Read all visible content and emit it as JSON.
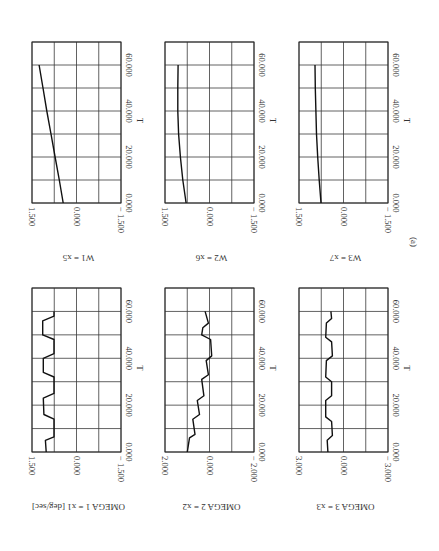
{
  "figure_label": "(a)",
  "chart_data": [
    {
      "type": "line",
      "id": "w1",
      "ylabel": "W1 = x5",
      "xlabel": "T",
      "value_ticks": [
        "1.500",
        "0.000",
        "− 1.500"
      ],
      "t_ticks": [
        "0.000",
        "20.000",
        "40.000",
        "60.000"
      ],
      "vlim": [
        -1.5,
        1.5
      ],
      "tlim": [
        0,
        70
      ],
      "grid": true,
      "points": [
        [
          0,
          0.45
        ],
        [
          10,
          0.58
        ],
        [
          20,
          0.72
        ],
        [
          30,
          0.86
        ],
        [
          40,
          1.0
        ],
        [
          50,
          1.13
        ],
        [
          60,
          1.26
        ]
      ]
    },
    {
      "type": "line",
      "id": "w2",
      "ylabel": "W2 = x6",
      "xlabel": "T",
      "value_ticks": [
        "1.500",
        "0.000",
        "− 1.500"
      ],
      "t_ticks": [
        "0.000",
        "20.000",
        "40.000",
        "60.000"
      ],
      "vlim": [
        -1.5,
        1.5
      ],
      "tlim": [
        0,
        70
      ],
      "grid": true,
      "points": [
        [
          0,
          0.79
        ],
        [
          10,
          0.9
        ],
        [
          20,
          0.98
        ],
        [
          30,
          1.04
        ],
        [
          40,
          1.07
        ],
        [
          50,
          1.07
        ],
        [
          60,
          1.06
        ]
      ]
    },
    {
      "type": "line",
      "id": "w3",
      "ylabel": "W3 = x7",
      "xlabel": "T",
      "value_ticks": [
        "1.500",
        "0.000",
        "− 1.500"
      ],
      "t_ticks": [
        "0.000",
        "20.000",
        "40.000",
        "60.000"
      ],
      "vlim": [
        -1.5,
        1.5
      ],
      "tlim": [
        0,
        70
      ],
      "grid": true,
      "points": [
        [
          0,
          0.76
        ],
        [
          10,
          0.82
        ],
        [
          20,
          0.87
        ],
        [
          30,
          0.91
        ],
        [
          40,
          0.93
        ],
        [
          50,
          0.95
        ],
        [
          60,
          0.96
        ]
      ]
    },
    {
      "type": "line",
      "id": "omega1",
      "ylabel": "OMEGA 1 = x1 [deg/sec]",
      "xlabel": "T",
      "value_ticks": [
        "1.500",
        "0.000",
        "− 1.500"
      ],
      "t_ticks": [
        "0.000",
        "20.000",
        "40.000",
        "60.000"
      ],
      "vlim": [
        -1.5,
        1.5
      ],
      "tlim": [
        0,
        70
      ],
      "grid": true,
      "points": [
        [
          0,
          1.02
        ],
        [
          5,
          1.05
        ],
        [
          6.5,
          0.76
        ],
        [
          14,
          0.76
        ],
        [
          16,
          1.1
        ],
        [
          23,
          1.12
        ],
        [
          25,
          0.76
        ],
        [
          32,
          0.76
        ],
        [
          34,
          1.12
        ],
        [
          40,
          1.12
        ],
        [
          42,
          0.76
        ],
        [
          48,
          0.76
        ],
        [
          50,
          1.14
        ],
        [
          56,
          1.14
        ],
        [
          58,
          0.76
        ],
        [
          60,
          0.76
        ]
      ]
    },
    {
      "type": "line",
      "id": "omega2",
      "ylabel": "OMEGA 2 = x2",
      "xlabel": "T",
      "value_ticks": [
        "2.000",
        "0.000",
        "− 2.000"
      ],
      "t_ticks": [
        "0.000",
        "20.000",
        "40.000",
        "60.000"
      ],
      "vlim": [
        -2.0,
        2.0
      ],
      "tlim": [
        0,
        70
      ],
      "grid": true,
      "points": [
        [
          0,
          1.0
        ],
        [
          6,
          0.9
        ],
        [
          7.5,
          0.65
        ],
        [
          14,
          0.75
        ],
        [
          16,
          0.45
        ],
        [
          22,
          0.55
        ],
        [
          24,
          0.25
        ],
        [
          31,
          0.35
        ],
        [
          33,
          0.05
        ],
        [
          39,
          0.15
        ],
        [
          41,
          -0.1
        ],
        [
          48,
          -0.05
        ],
        [
          50,
          0.35
        ],
        [
          53,
          0.3
        ],
        [
          55,
          0.05
        ],
        [
          60,
          0.2
        ]
      ]
    },
    {
      "type": "line",
      "id": "omega3",
      "ylabel": "OMEGA 3 = x3",
      "xlabel": "T",
      "value_ticks": [
        "3.000",
        "0.000",
        "− 3.000"
      ],
      "t_ticks": [
        "0.000",
        "20.000",
        "40.000",
        "60.000"
      ],
      "vlim": [
        -3.0,
        3.0
      ],
      "tlim": [
        0,
        70
      ],
      "grid": true,
      "points": [
        [
          0,
          1.05
        ],
        [
          5,
          1.1
        ],
        [
          7,
          0.75
        ],
        [
          13,
          0.8
        ],
        [
          15,
          1.2
        ],
        [
          22,
          1.2
        ],
        [
          24,
          0.8
        ],
        [
          30,
          0.8
        ],
        [
          32,
          1.2
        ],
        [
          39,
          1.15
        ],
        [
          41,
          0.75
        ],
        [
          47,
          0.8
        ],
        [
          49,
          1.2
        ],
        [
          55,
          1.15
        ],
        [
          57,
          0.8
        ],
        [
          60,
          0.85
        ]
      ]
    }
  ]
}
